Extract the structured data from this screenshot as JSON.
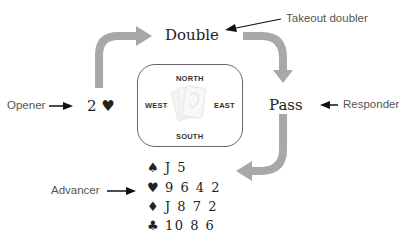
{
  "diagram": {
    "bids": {
      "opener_bid": "2 ♥",
      "takeout_bid": "Double",
      "responder_bid": "Pass"
    },
    "labels": {
      "opener": "Opener",
      "takeout_doubler": "Takeout doubler",
      "responder": "Responder",
      "advancer": "Advancer"
    },
    "compass": {
      "north": "NORTH",
      "south": "SOUTH",
      "east": "EAST",
      "west": "WEST",
      "center_icon": "playing-cards-icon"
    },
    "advancer_hand": [
      {
        "suit": "spades",
        "symbol": "♠",
        "cards": "J 5"
      },
      {
        "suit": "hearts",
        "symbol": "♥",
        "cards": "9 6 4 2"
      },
      {
        "suit": "diamonds",
        "symbol": "♦",
        "cards": "J 8 7 2"
      },
      {
        "suit": "clubs",
        "symbol": "♣",
        "cards": "10 8 6"
      }
    ],
    "colors": {
      "flow_arrow": "#a8a8a8",
      "pointer_arrow": "#111111",
      "text": "#222222",
      "label_text": "#555555"
    }
  }
}
